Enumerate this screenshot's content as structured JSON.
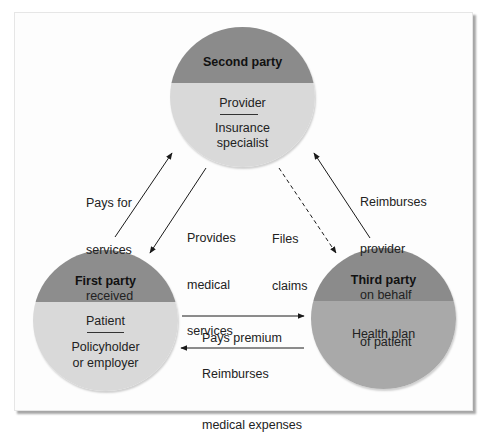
{
  "diagram": {
    "type": "three-party health insurance relationship",
    "colors": {
      "header_gray": "#8b8b8b",
      "body_light_gray": "#d9d9d9",
      "body_mid_gray": "#a9a9a9",
      "arrow": "#1a1a1a"
    },
    "parties": {
      "second": {
        "title": "Second party",
        "primary_role": "Provider",
        "secondary_role_line1": "Insurance",
        "secondary_role_line2": "specialist"
      },
      "first": {
        "title": "First party",
        "primary_role": "Patient",
        "secondary_role_line1": "Policyholder",
        "secondary_role_line2": "or employer"
      },
      "third": {
        "title": "Third party",
        "primary_role": "Health plan"
      }
    },
    "flows": {
      "pays_for_services": {
        "line1": "Pays for",
        "line2": "services",
        "line3": "received",
        "from": "First party",
        "to": "Second party",
        "style": "solid"
      },
      "provides_services": {
        "line1": "Provides",
        "line2": "medical",
        "line3": "services",
        "from": "Second party",
        "to": "First party",
        "style": "solid"
      },
      "files_claims": {
        "line1": "Files",
        "line2": "claims",
        "from": "Second party",
        "to": "Third party",
        "style": "dashed"
      },
      "reimburses_provider": {
        "line1": "Reimburses",
        "line2": "provider",
        "line3": "on behalf",
        "line4": "of patient",
        "from": "Third party",
        "to": "Second party",
        "style": "solid"
      },
      "pays_premium": {
        "line1": "Pays premium",
        "from": "First party",
        "to": "Third party",
        "style": "solid"
      },
      "reimburses_expenses": {
        "line1": "Reimburses",
        "line2": "medical expenses",
        "from": "Third party",
        "to": "First party",
        "style": "solid"
      }
    }
  }
}
